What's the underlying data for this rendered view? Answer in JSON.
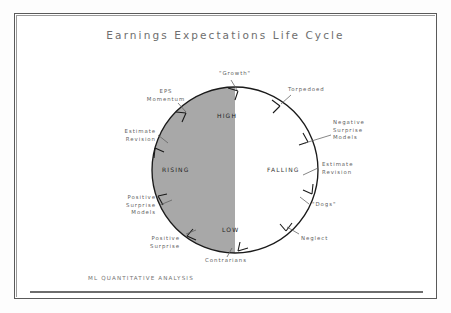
{
  "title": "Earnings Expectations Life Cycle",
  "footer": "ML QUANTITATIVE ANALYSIS",
  "colors": {
    "shaded_half": "#a8a8a8",
    "unshaded_half": "#ffffff",
    "circle_stroke": "#1a1a1a",
    "frame": "#5a5a5a",
    "title_text": "#6e6e6e",
    "label_text": "#5f5f5f"
  },
  "circle": {
    "center_x": 235,
    "center_y": 170,
    "radius": 83,
    "shaded_side": "left",
    "direction": "clockwise"
  },
  "interior_labels": {
    "top": "HIGH",
    "bottom": "LOW",
    "left_half": "RISING",
    "right_half": "FALLING"
  },
  "outer_labels": [
    {
      "id": "growth",
      "text": "\"Growth\"",
      "lines": [
        "\"Growth\""
      ]
    },
    {
      "id": "torpedoed",
      "text": "Torpedoed",
      "lines": [
        "Torpedoed"
      ]
    },
    {
      "id": "eps-momentum",
      "text": "EPS Momentum",
      "lines": [
        "EPS",
        "Momentum"
      ]
    },
    {
      "id": "negative-surprise-models",
      "text": "Negative Surprise Models",
      "lines": [
        "Negative",
        "Surprise",
        "Models"
      ]
    },
    {
      "id": "estimate-revision-left",
      "text": "Estimate Revision",
      "lines": [
        "Estimate",
        "Revision"
      ]
    },
    {
      "id": "estimate-revision-right",
      "text": "Estimate Revision",
      "lines": [
        "Estimate",
        "Revision"
      ]
    },
    {
      "id": "positive-surprise-models",
      "text": "Positive Surprise Models",
      "lines": [
        "Positive",
        "Surprise",
        "Models"
      ]
    },
    {
      "id": "dogs",
      "text": "\"Dogs\"",
      "lines": [
        "\"Dogs\""
      ]
    },
    {
      "id": "positive-surprise",
      "text": "Positive Surprise",
      "lines": [
        "Positive",
        "Surprise"
      ]
    },
    {
      "id": "neglect",
      "text": "Neglect",
      "lines": [
        "Neglect"
      ]
    },
    {
      "id": "contrarians",
      "text": "Contrarians",
      "lines": [
        "Contrarians"
      ]
    }
  ]
}
